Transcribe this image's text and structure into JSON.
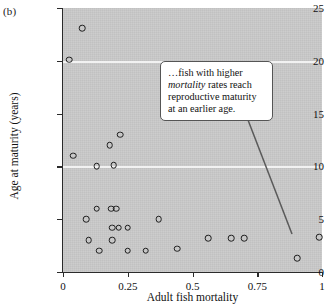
{
  "panel": {
    "label": "(b)"
  },
  "chart_data": {
    "type": "scatter",
    "title": "",
    "xlabel": "Adult fish mortality",
    "ylabel": "Age at maturity (years)",
    "xlim": [
      0,
      1
    ],
    "ylim": [
      0,
      25
    ],
    "xticks": [
      "0",
      "0.25",
      "0.5",
      "0.75",
      "1"
    ],
    "xtick_values": [
      0,
      0.25,
      0.5,
      0.75,
      1
    ],
    "yticks": [
      "0",
      "5",
      "10",
      "15",
      "20",
      "25"
    ],
    "ytick_values": [
      0,
      5,
      10,
      15,
      20,
      25
    ],
    "grid": "horizontal",
    "gridline_values": [
      10,
      20
    ],
    "legend": "none",
    "plot_background": "#c9c9c9",
    "gridline_color": "#f2f2f2",
    "marker": "open-circle",
    "marker_color": "#1d1d1d",
    "points": [
      {
        "x": 0.024,
        "y": 20.1
      },
      {
        "x": 0.073,
        "y": 23.1
      },
      {
        "x": 0.04,
        "y": 11.0
      },
      {
        "x": 0.13,
        "y": 10.0
      },
      {
        "x": 0.18,
        "y": 12.0
      },
      {
        "x": 0.22,
        "y": 13.0
      },
      {
        "x": 0.195,
        "y": 10.1
      },
      {
        "x": 0.09,
        "y": 5.0
      },
      {
        "x": 0.13,
        "y": 6.0
      },
      {
        "x": 0.185,
        "y": 6.0
      },
      {
        "x": 0.205,
        "y": 6.0
      },
      {
        "x": 0.19,
        "y": 4.2
      },
      {
        "x": 0.215,
        "y": 4.2
      },
      {
        "x": 0.25,
        "y": 4.2
      },
      {
        "x": 0.1,
        "y": 3.0
      },
      {
        "x": 0.19,
        "y": 3.0
      },
      {
        "x": 0.14,
        "y": 2.0
      },
      {
        "x": 0.25,
        "y": 2.0
      },
      {
        "x": 0.32,
        "y": 2.0
      },
      {
        "x": 0.37,
        "y": 5.0
      },
      {
        "x": 0.44,
        "y": 2.2
      },
      {
        "x": 0.56,
        "y": 3.2
      },
      {
        "x": 0.65,
        "y": 3.2
      },
      {
        "x": 0.7,
        "y": 3.2
      },
      {
        "x": 0.905,
        "y": 1.3
      },
      {
        "x": 0.99,
        "y": 3.3
      }
    ],
    "annotation": {
      "text_parts": [
        {
          "text": "…fish with higher ",
          "style": "normal"
        },
        {
          "text": "mortality",
          "style": "italic"
        },
        {
          "text": " rates reach reproductive maturity at an earlier age.",
          "style": "normal"
        }
      ],
      "plain_text": "…fish with higher mortality rates reach reproductive maturity at an earlier age.",
      "leader_line": {
        "x1": 248,
        "y1": 120,
        "x2": 292,
        "y2": 234,
        "color": "#5a5a5a"
      }
    }
  }
}
